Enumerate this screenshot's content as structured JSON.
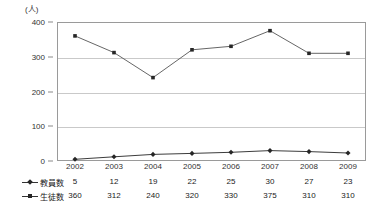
{
  "chart_data": {
    "type": "line",
    "title": "",
    "subtitle": "",
    "unit_label": "(人)",
    "xlabel": "",
    "ylabel": "",
    "categories": [
      "2002",
      "2003",
      "2004",
      "2005",
      "2006",
      "2007",
      "2008",
      "2009"
    ],
    "series": [
      {
        "name": "教員数",
        "marker": "diamond",
        "color": "#262626",
        "values": [
          5,
          12,
          19,
          22,
          25,
          30,
          27,
          23
        ]
      },
      {
        "name": "生徒数",
        "marker": "square",
        "color": "#555555",
        "values": [
          360,
          312,
          240,
          320,
          330,
          375,
          310,
          310
        ]
      }
    ],
    "ylim": [
      0,
      400
    ],
    "yticks": [
      0,
      100,
      200,
      300,
      400
    ],
    "ytick_labels": [
      "0",
      "100",
      "200",
      "300",
      "400"
    ],
    "grid": true,
    "gridlines_at": [
      100,
      200,
      300
    ],
    "legend_position": "table-left",
    "annotations": []
  },
  "table": {
    "header_row": [
      "2002",
      "2003",
      "2004",
      "2005",
      "2006",
      "2007",
      "2008",
      "2009"
    ],
    "rows": [
      {
        "label": "教員数",
        "marker": "diamond",
        "values": [
          "5",
          "12",
          "19",
          "22",
          "25",
          "30",
          "27",
          "23"
        ]
      },
      {
        "label": "生徒数",
        "marker": "square",
        "values": [
          "360",
          "312",
          "240",
          "320",
          "330",
          "375",
          "310",
          "310"
        ]
      }
    ]
  },
  "colors": {
    "plot_border": "#9a9a9a",
    "gridline": "#c9c9c9",
    "teachers_line": "#262626",
    "students_line": "#555555",
    "text": "#1a1a1a",
    "background": "#ffffff"
  }
}
